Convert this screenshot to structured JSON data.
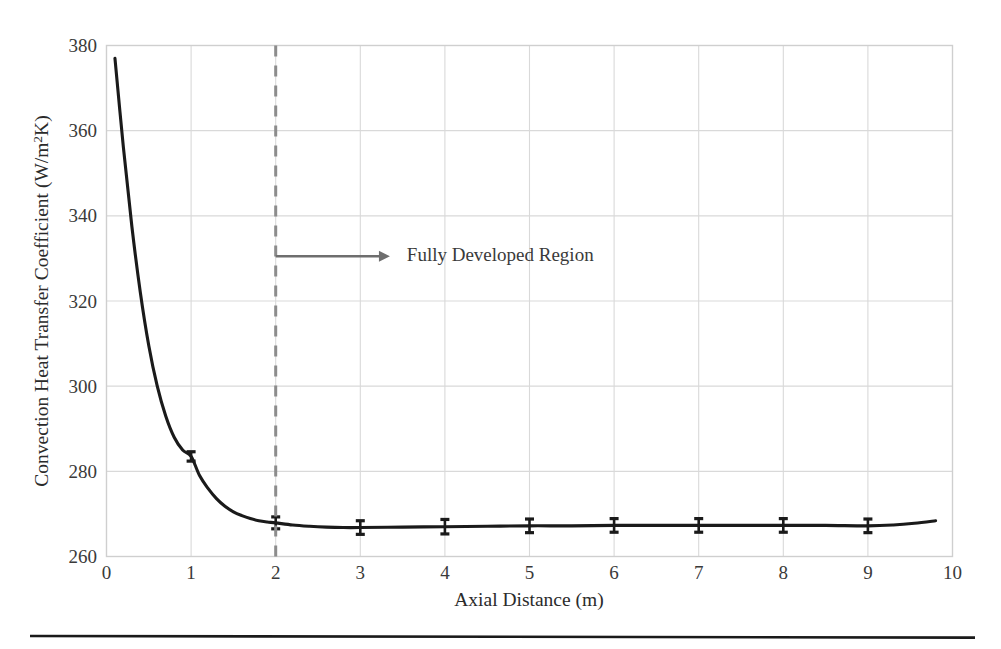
{
  "figure": {
    "background_color": "#ffffff",
    "rule_color": "#1a1a1a"
  },
  "chart_data": {
    "type": "line",
    "title": "",
    "xlabel": "Axial Distance (m)",
    "ylabel": "Convection Heat Transfer Coefficient (W/m²K)",
    "xlim": [
      0,
      10
    ],
    "ylim": [
      260,
      380
    ],
    "xticks": [
      0,
      1,
      2,
      3,
      4,
      5,
      6,
      7,
      8,
      9,
      10
    ],
    "xtick_labels": [
      "0",
      "1",
      "2",
      "3",
      "4",
      "5",
      "6",
      "7",
      "8",
      "9",
      "10"
    ],
    "yticks": [
      260,
      280,
      300,
      320,
      340,
      360,
      380
    ],
    "ytick_labels": [
      "260",
      "280",
      "300",
      "320",
      "340",
      "360",
      "380"
    ],
    "grid": true,
    "grid_color": "#d9d9d9",
    "frame_color": "#cfcfcf",
    "legend": "none",
    "series": [
      {
        "name": "Convection heat transfer coefficient",
        "color": "#1a1a1a",
        "line_width": 3.1,
        "x": [
          0.1,
          0.2,
          0.3,
          0.4,
          0.5,
          0.6,
          0.7,
          0.8,
          0.9,
          1.0,
          1.1,
          1.2,
          1.3,
          1.4,
          1.5,
          1.6,
          1.7,
          1.8,
          1.9,
          2.0,
          2.2,
          2.4,
          2.6,
          2.8,
          3.0,
          3.5,
          4.0,
          4.5,
          5.0,
          5.5,
          6.0,
          6.5,
          7.0,
          7.5,
          8.0,
          8.5,
          9.0,
          9.3,
          9.55,
          9.8
        ],
        "y": [
          377.0,
          356.0,
          337.5,
          322.0,
          309.5,
          300.0,
          293.0,
          288.0,
          285.0,
          283.5,
          279.0,
          276.0,
          273.6,
          271.8,
          270.5,
          269.6,
          268.9,
          268.4,
          268.1,
          267.9,
          267.4,
          267.1,
          266.9,
          266.8,
          266.8,
          266.9,
          267.0,
          267.1,
          267.2,
          267.2,
          267.3,
          267.3,
          267.3,
          267.3,
          267.3,
          267.3,
          267.2,
          267.4,
          267.8,
          268.4
        ]
      }
    ],
    "error_bars": {
      "color": "#1a1a1a",
      "cap_width": 9,
      "x": [
        1.0,
        2.0,
        3.0,
        4.0,
        5.0,
        6.0,
        7.0,
        8.0,
        9.0
      ],
      "y": [
        283.5,
        267.9,
        266.8,
        267.0,
        267.2,
        267.3,
        267.3,
        267.3,
        267.2
      ],
      "yerr": [
        1.1,
        1.4,
        1.6,
        1.7,
        1.6,
        1.6,
        1.6,
        1.6,
        1.6
      ]
    },
    "annotations": [
      {
        "type": "vline",
        "name": "fully-developed-boundary",
        "x": 2.0,
        "style": "dashed",
        "color": "#8c8c8c",
        "line_width": 3
      },
      {
        "type": "arrow",
        "name": "fully-developed-arrow",
        "x_start": 2.0,
        "x_end": 3.35,
        "y": 330.5,
        "color": "#6e6e6e"
      },
      {
        "type": "text",
        "name": "fully-developed-text",
        "text": "Fully Developed Region",
        "x": 3.55,
        "y": 330.5,
        "color": "#3a3a3a"
      }
    ]
  }
}
